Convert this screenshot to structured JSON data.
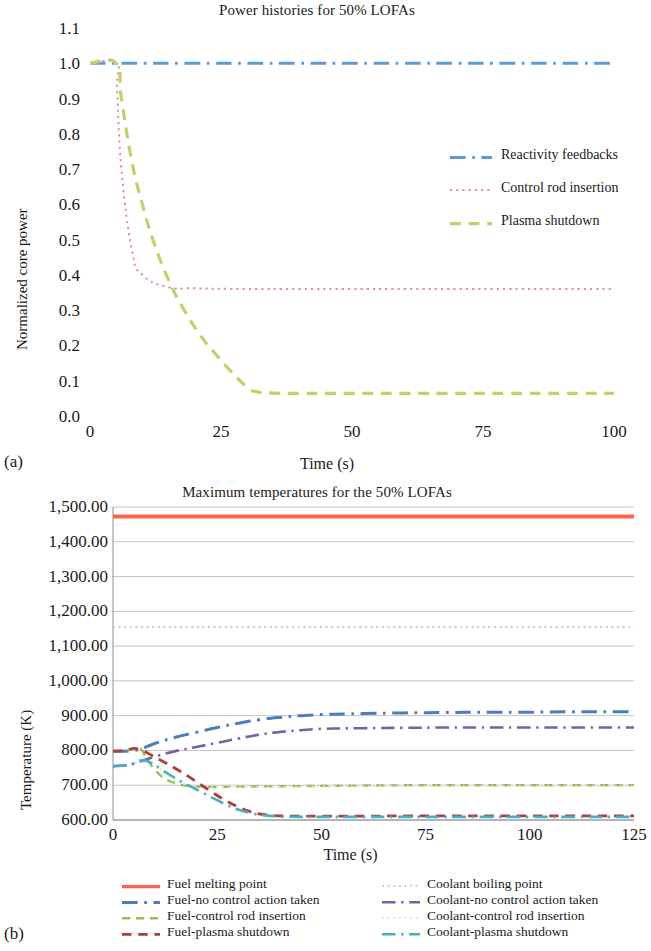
{
  "figure": {
    "subfig_a": "(a)",
    "subfig_b": "(b)"
  },
  "chart_data": [
    {
      "id": "power-histories",
      "type": "line",
      "title": "Power histories for 50% LOFAs",
      "xlabel": "Time (s)",
      "ylabel": "Normalized core power",
      "xlim": [
        0,
        100
      ],
      "ylim": [
        0.0,
        1.1
      ],
      "xticks": [
        0,
        25,
        50,
        75,
        100
      ],
      "xticklabels": [
        "0",
        "25",
        "50",
        "75",
        "100"
      ],
      "yticks": [
        0.0,
        0.1,
        0.2,
        0.3,
        0.4,
        0.5,
        0.6,
        0.7,
        0.8,
        0.9,
        1.0,
        1.1
      ],
      "yticklabels": [
        "0.0",
        "0.1",
        "0.2",
        "0.3",
        "0.4",
        "0.5",
        "0.6",
        "0.7",
        "0.8",
        "0.9",
        "1.0",
        "1.1"
      ],
      "grid": false,
      "legend_position": "inside-right",
      "series": [
        {
          "name": "Reactivity feedbacks",
          "color": "#5B9BD5",
          "dash": "dash-dot",
          "x": [
            0,
            5,
            10,
            20,
            30,
            40,
            50,
            60,
            70,
            80,
            90,
            100
          ],
          "y": [
            1.0,
            1.0,
            1.0,
            1.0,
            1.0,
            1.0,
            1.0,
            1.0,
            1.0,
            1.0,
            1.0,
            1.0
          ]
        },
        {
          "name": "Control rod insertion",
          "color": "#D99694",
          "dash": "dotted",
          "x": [
            0,
            5,
            5.2,
            6,
            8,
            10,
            15,
            20,
            30,
            40,
            50,
            60,
            70,
            80,
            90,
            100
          ],
          "y": [
            1.0,
            1.0,
            0.92,
            0.7,
            0.47,
            0.4,
            0.365,
            0.362,
            0.36,
            0.36,
            0.36,
            0.36,
            0.36,
            0.36,
            0.36,
            0.36
          ]
        },
        {
          "name": "Plasma shutdown",
          "color": "#C3D069",
          "dash": "dashed",
          "x": [
            0,
            5,
            6,
            8,
            10,
            12,
            15,
            18,
            21,
            24,
            27,
            30,
            32,
            35,
            40,
            50,
            60,
            70,
            80,
            90,
            100
          ],
          "y": [
            1.0,
            1.0,
            0.9,
            0.72,
            0.6,
            0.5,
            0.385,
            0.3,
            0.23,
            0.175,
            0.125,
            0.082,
            0.068,
            0.065,
            0.064,
            0.064,
            0.064,
            0.064,
            0.064,
            0.064,
            0.064
          ]
        }
      ]
    },
    {
      "id": "maximum-temperatures",
      "type": "line",
      "title": "Maximum temperatures for the 50% LOFAs",
      "xlabel": "Time (s)",
      "ylabel": "Temperature (K)",
      "xlim": [
        0,
        125
      ],
      "ylim": [
        600,
        1500
      ],
      "xticks": [
        0,
        25,
        50,
        75,
        100,
        125
      ],
      "xticklabels": [
        "0",
        "25",
        "50",
        "75",
        "100",
        "125"
      ],
      "yticks": [
        600,
        700,
        800,
        900,
        1000,
        1100,
        1200,
        1300,
        1400,
        1500
      ],
      "yticklabels": [
        "600.00",
        "700.00",
        "800.00",
        "900.00",
        "1,000.00",
        "1,100.00",
        "1,200.00",
        "1,300.00",
        "1,400.00",
        "1,500.00"
      ],
      "grid": true,
      "legend_position": "below",
      "series": [
        {
          "name": "Fuel melting point",
          "color": "#FF6347",
          "dash": "solid",
          "x": [
            0,
            125
          ],
          "y": [
            1473,
            1473
          ]
        },
        {
          "name": "Coolant boiling point",
          "color": "#C9C9C9",
          "dash": "dotted",
          "x": [
            0,
            125
          ],
          "y": [
            1155,
            1155
          ]
        },
        {
          "name": "Fuel-no control action taken",
          "color": "#4A7EBB",
          "dash": "dash-dot",
          "x": [
            0,
            3,
            5,
            7,
            10,
            15,
            20,
            25,
            30,
            35,
            40,
            45,
            50,
            60,
            70,
            80,
            90,
            100,
            110,
            120,
            125
          ],
          "y": [
            798,
            798,
            800,
            806,
            820,
            838,
            852,
            866,
            878,
            888,
            895,
            900,
            903,
            906,
            908,
            909,
            910,
            910,
            911,
            911,
            911
          ]
        },
        {
          "name": "Coolant-no control action taken",
          "color": "#7A5EA8",
          "dash": "dash-dot",
          "x": [
            0,
            3,
            5,
            7,
            10,
            15,
            20,
            25,
            30,
            35,
            40,
            45,
            50,
            60,
            70,
            80,
            90,
            100,
            110,
            120,
            125
          ],
          "y": [
            755,
            757,
            762,
            770,
            782,
            798,
            810,
            822,
            834,
            845,
            853,
            858,
            862,
            864,
            865,
            866,
            866,
            866,
            866,
            866,
            866
          ]
        },
        {
          "name": "Fuel-control rod insertion",
          "color": "#9BBB59",
          "dash": "dashed",
          "x": [
            0,
            3,
            5,
            6,
            7,
            8,
            10,
            12,
            14,
            16,
            18,
            20,
            25,
            30,
            40,
            50,
            60,
            75,
            90,
            100,
            110,
            120,
            125
          ],
          "y": [
            798,
            800,
            806,
            808,
            800,
            778,
            745,
            722,
            710,
            702,
            698,
            696,
            695,
            696,
            697,
            698,
            699,
            700,
            700,
            700,
            700,
            700,
            700
          ]
        },
        {
          "name": "Coolant-control rod insertion",
          "color": "#DCE6C8",
          "dash": "dotted",
          "x": [
            0,
            3,
            5,
            7,
            10,
            13,
            16,
            20,
            25,
            30,
            40,
            50,
            60,
            75,
            90,
            100,
            110,
            120,
            125
          ],
          "y": [
            755,
            757,
            763,
            772,
            760,
            730,
            708,
            697,
            694,
            694,
            695,
            696,
            697,
            698,
            698,
            698,
            698,
            698,
            698
          ]
        },
        {
          "name": "Fuel-plasma shutdown",
          "color": "#AE3E37",
          "dash": "dashed",
          "x": [
            0,
            3,
            5,
            7,
            9,
            12,
            15,
            18,
            21,
            24,
            27,
            30,
            33,
            36,
            40,
            45,
            50,
            60,
            70,
            80,
            90,
            100,
            110,
            120,
            125
          ],
          "y": [
            798,
            800,
            806,
            800,
            788,
            768,
            748,
            726,
            702,
            678,
            656,
            638,
            624,
            616,
            612,
            611,
            611,
            611,
            612,
            612,
            612,
            612,
            612,
            612,
            612
          ]
        },
        {
          "name": "Coolant-plasma shutdown",
          "color": "#4BACC6",
          "dash": "dash-dot",
          "x": [
            0,
            3,
            5,
            7,
            9,
            12,
            15,
            18,
            21,
            24,
            27,
            30,
            33,
            36,
            40,
            45,
            50,
            60,
            70,
            80,
            90,
            100,
            110,
            120,
            125
          ],
          "y": [
            755,
            757,
            763,
            772,
            765,
            742,
            720,
            700,
            682,
            663,
            645,
            630,
            620,
            614,
            610,
            609,
            609,
            609,
            609,
            609,
            609,
            609,
            609,
            609,
            609
          ]
        }
      ]
    }
  ],
  "chart_a": {
    "title": "Power histories for 50% LOFAs",
    "xlabel": "Time (s)",
    "ylabel": "Normalized core power",
    "yticklabels": [
      "1.1",
      "1.0",
      "0.9",
      "0.8",
      "0.7",
      "0.6",
      "0.5",
      "0.4",
      "0.3",
      "0.2",
      "0.1",
      "0.0"
    ],
    "xticklabels": [
      "0",
      "25",
      "50",
      "75",
      "100"
    ],
    "legend": [
      {
        "label": "Reactivity feedbacks",
        "color": "#5B9BD5"
      },
      {
        "label": "Control rod insertion",
        "color": "#D99694"
      },
      {
        "label": "Plasma shutdown",
        "color": "#C3D069"
      }
    ]
  },
  "chart_b": {
    "title": "Maximum temperatures for the 50% LOFAs",
    "xlabel": "Time (s)",
    "ylabel": "Temperature (K)",
    "yticklabels": [
      "1,500.00",
      "1,400.00",
      "1,300.00",
      "1,200.00",
      "1,100.00",
      "1,000.00",
      "900.00",
      "800.00",
      "700.00",
      "600.00"
    ],
    "xticklabels": [
      "0",
      "25",
      "50",
      "75",
      "100",
      "125"
    ],
    "legend_left": [
      {
        "label": "Fuel melting point",
        "color": "#FF6347"
      },
      {
        "label": "Fuel-no control action taken",
        "color": "#4A7EBB"
      },
      {
        "label": "Fuel-control rod insertion",
        "color": "#9BBB59"
      },
      {
        "label": "Fuel-plasma shutdown",
        "color": "#AE3E37"
      }
    ],
    "legend_right": [
      {
        "label": "Coolant boiling point",
        "color": "#C9C9C9"
      },
      {
        "label": "Coolant-no control action taken",
        "color": "#7A5EA8"
      },
      {
        "label": "Coolant-control rod insertion",
        "color": "#DCE6C8"
      },
      {
        "label": "Coolant-plasma shutdown",
        "color": "#4BACC6"
      }
    ]
  }
}
